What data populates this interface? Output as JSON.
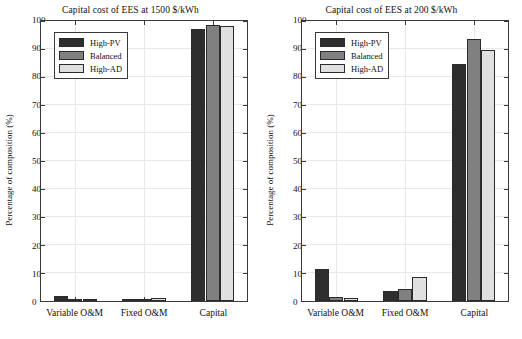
{
  "figure": {
    "ylabel": "Percentage of composition (%)",
    "colors": {
      "high_pv": "#2e2e2e",
      "balanced": "#808080",
      "high_ad": "#e0e0e0",
      "axis": "#3a3a3a",
      "grid": "#e8e8e8",
      "background": "#ffffff"
    }
  },
  "chart_data": [
    {
      "type": "bar",
      "title": "Capital cost of EES at 1500 $/kWh",
      "xlabel": "",
      "ylabel": "Percentage of composition (%)",
      "categories": [
        "Variable O&M",
        "Fixed O&M",
        "Capital"
      ],
      "series": [
        {
          "name": "High-PV",
          "color": "#2e2e2e",
          "values": [
            1.7,
            0.5,
            97.3
          ]
        },
        {
          "name": "Balanced",
          "color": "#808080",
          "values": [
            0.3,
            0.6,
            98.7
          ]
        },
        {
          "name": "High-AD",
          "color": "#e0e0e0",
          "values": [
            0.2,
            1.0,
            98.1
          ]
        }
      ],
      "ylim": [
        0,
        100
      ],
      "yticks": [
        0,
        10,
        20,
        30,
        40,
        50,
        60,
        70,
        80,
        90,
        100
      ],
      "grid": true,
      "legend_position": "upper-left"
    },
    {
      "type": "bar",
      "title": "Capital cost of EES at 200 $/kWh",
      "xlabel": "",
      "ylabel": "Percentage of composition (%)",
      "categories": [
        "Variable O&M",
        "Fixed O&M",
        "Capital"
      ],
      "series": [
        {
          "name": "High-PV",
          "color": "#2e2e2e",
          "values": [
            11.5,
            3.4,
            84.5
          ]
        },
        {
          "name": "Balanced",
          "color": "#808080",
          "values": [
            1.6,
            4.2,
            93.5
          ]
        },
        {
          "name": "High-AD",
          "color": "#e0e0e0",
          "values": [
            1.1,
            8.6,
            89.7
          ]
        }
      ],
      "ylim": [
        0,
        100
      ],
      "yticks": [
        0,
        10,
        20,
        30,
        40,
        50,
        60,
        70,
        80,
        90,
        100
      ],
      "grid": true,
      "legend_position": "upper-left"
    }
  ]
}
